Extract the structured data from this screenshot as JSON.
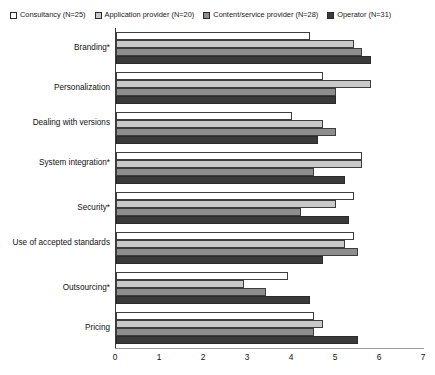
{
  "chart_data": {
    "type": "bar",
    "orientation": "horizontal",
    "title": "",
    "subtitle": "",
    "xlabel": "",
    "ylabel": "",
    "xlim": [
      0,
      7
    ],
    "xticks": [
      0,
      1,
      2,
      3,
      4,
      5,
      6,
      7
    ],
    "grid": false,
    "legend_position": "top-left",
    "categories": [
      "Branding*",
      "Personalization",
      "Dealing with versions",
      "System integration*",
      "Security*",
      "Use of accepted standards",
      "Outsourcing*",
      "Pricing"
    ],
    "series": [
      {
        "name": "Consultancy (N=25)",
        "color": "#ffffff",
        "values": [
          4.4,
          4.7,
          4.0,
          5.6,
          5.4,
          5.4,
          3.9,
          4.5
        ]
      },
      {
        "name": "Application provider (N=20)",
        "color": "#c9c9c9",
        "values": [
          5.4,
          5.8,
          4.7,
          5.6,
          5.0,
          5.2,
          2.9,
          4.7
        ]
      },
      {
        "name": "Content/service provider (N=28)",
        "color": "#8e8e8e",
        "values": [
          5.6,
          5.0,
          5.0,
          4.5,
          4.2,
          5.5,
          3.4,
          4.5
        ]
      },
      {
        "name": "Operator (N=31)",
        "color": "#3a3a3a",
        "values": [
          5.8,
          5.0,
          4.6,
          5.2,
          5.3,
          4.7,
          4.4,
          5.5
        ]
      }
    ]
  },
  "legend": {
    "items": [
      {
        "label": "Consultancy (N=25)",
        "swatch": "#ffffff"
      },
      {
        "label": "Application provider (N=20)",
        "swatch": "#c9c9c9"
      },
      {
        "label": "Content/service provider (N=28)",
        "swatch": "#8e8e8e"
      },
      {
        "label": "Operator (N=31)",
        "swatch": "#3a3a3a"
      }
    ]
  },
  "axis": {
    "x_tick_labels": [
      "0",
      "1",
      "2",
      "3",
      "4",
      "5",
      "6",
      "7"
    ],
    "y_tick_labels": [
      "Branding*",
      "Personalization",
      "Dealing with versions",
      "System integration*",
      "Security*",
      "Use of accepted standards",
      "Outsourcing*",
      "Pricing"
    ]
  }
}
